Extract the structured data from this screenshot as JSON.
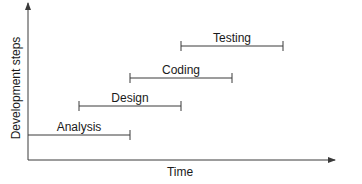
{
  "diagram": {
    "type": "waterfall-timeline",
    "y_axis_label": "Development steps",
    "x_axis_label": "Time",
    "colors": {
      "line": "#3a3a3a",
      "text": "#1a1a1a",
      "background": "#ffffff"
    },
    "phases": [
      {
        "label": "Analysis",
        "start_x": 28,
        "end_x": 130,
        "y": 135,
        "label_x": 79,
        "left_tick": false
      },
      {
        "label": "Design",
        "start_x": 79,
        "end_x": 181,
        "y": 106,
        "label_x": 130,
        "left_tick": true
      },
      {
        "label": "Coding",
        "start_x": 130,
        "end_x": 232,
        "y": 78,
        "label_x": 181,
        "left_tick": true
      },
      {
        "label": "Testing",
        "start_x": 181,
        "end_x": 283,
        "y": 46,
        "label_x": 232,
        "left_tick": true
      }
    ]
  }
}
